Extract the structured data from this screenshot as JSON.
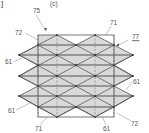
{
  "figure": {
    "panel_label": "(c)",
    "corner_mark": "]",
    "labels": [
      {
        "id": "label-75",
        "text": "75",
        "x": 33,
        "y": 13
      },
      {
        "id": "label-71-top",
        "text": "71",
        "x": 110,
        "y": 25
      },
      {
        "id": "label-77",
        "text": "77",
        "x": 128,
        "y": 39
      },
      {
        "id": "label-72-top",
        "text": "72",
        "x": 17,
        "y": 35
      },
      {
        "id": "label-61-left-top",
        "text": "61",
        "x": 6,
        "y": 64
      },
      {
        "id": "label-61-right",
        "text": "61",
        "x": 133,
        "y": 84
      },
      {
        "id": "label-61-left-bottom",
        "text": "61",
        "x": 8,
        "y": 112
      },
      {
        "id": "label-71-bottom",
        "text": "71",
        "x": 35,
        "y": 130
      },
      {
        "id": "label-61-bottom",
        "text": "61",
        "x": 104,
        "y": 130
      },
      {
        "id": "label-72-bottom",
        "text": "72",
        "x": 132,
        "y": 125
      }
    ],
    "colors": {
      "fill": "#d9d9d9",
      "line": "#444444",
      "dash": "#777777"
    }
  }
}
